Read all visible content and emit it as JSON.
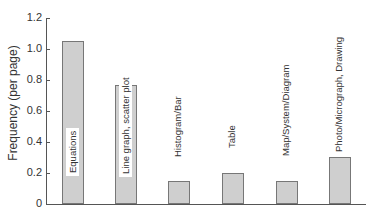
{
  "chart_data": {
    "type": "bar",
    "title": "",
    "xlabel": "",
    "ylabel": "Frequency (per page)",
    "ylim": [
      0,
      1.2
    ],
    "yticks": [
      "0",
      "0.2",
      "0.4",
      "0.6",
      "0.8",
      "1.0",
      "1.2"
    ],
    "grid": false,
    "legend": null,
    "categories": [
      "Equations",
      "Line graph, scatter plot",
      "Histogram/Bar",
      "Table",
      "Map/System/Diagram",
      "Photo/Micrograph, Drawing"
    ],
    "values": [
      1.05,
      0.77,
      0.15,
      0.2,
      0.15,
      0.3
    ],
    "bar_color": "#cfcfcf",
    "bar_edge_color": "#777777"
  }
}
